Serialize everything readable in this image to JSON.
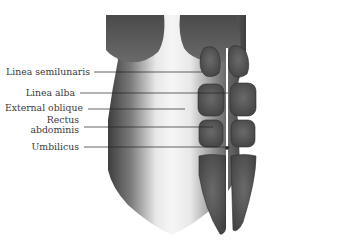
{
  "figure": {
    "labels": [
      {
        "id": "linea-semilunaris",
        "text": "Linea semilunaris",
        "text_x": 92,
        "text_y": 72,
        "target": [
          202,
          72
        ]
      },
      {
        "id": "linea-alba",
        "text": "Linea alba",
        "text_x": 77,
        "text_y": 93,
        "target": [
          228,
          93
        ]
      },
      {
        "id": "external-oblique",
        "text": "External oblique",
        "text_x": 84,
        "text_y": 109,
        "target": [
          185,
          109
        ]
      },
      {
        "id": "rectus-abdominis",
        "text_line1": "Rectus",
        "text_line2": "abdominis",
        "text_x": 81,
        "text_y": 127,
        "target": [
          213,
          127
        ]
      },
      {
        "id": "umbilicus",
        "text": "Umbilicus",
        "text_x": 80,
        "text_y": 147,
        "target": [
          230,
          147
        ]
      }
    ],
    "colors": {
      "muscle": "#5a5a5a",
      "muscle_dark": "#333333",
      "skin_light": "#f2f2f2",
      "line": "#222222",
      "text": "#3a3a3a"
    }
  }
}
